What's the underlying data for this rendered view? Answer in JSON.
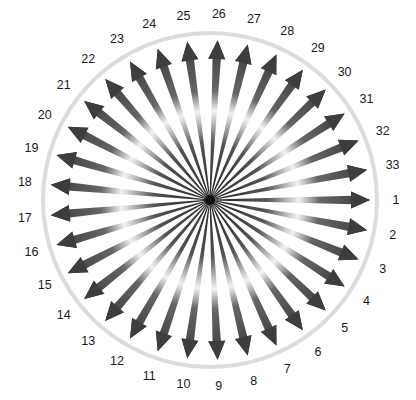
{
  "diagram": {
    "type": "radial-arrow-starburst",
    "center": {
      "x": 210,
      "y": 200
    },
    "ring_radius": 167,
    "arrow_tip_radius": 160,
    "label_radius": 186,
    "start_angle_deg": 0,
    "direction": "clockwise",
    "colors": {
      "arrow_dark": "#3a3a3a",
      "arrow_mid": "#6e6e6e",
      "arrow_highlight": "#f2f2f2",
      "ring": "#d9d9d9",
      "hub": "#111111",
      "label": "#1a1a1a"
    },
    "arrows": [
      {
        "label": "1"
      },
      {
        "label": "2"
      },
      {
        "label": "3"
      },
      {
        "label": "4"
      },
      {
        "label": "5"
      },
      {
        "label": "6"
      },
      {
        "label": "7"
      },
      {
        "label": "8"
      },
      {
        "label": "9"
      },
      {
        "label": "10"
      },
      {
        "label": "11"
      },
      {
        "label": "12"
      },
      {
        "label": "13"
      },
      {
        "label": "14"
      },
      {
        "label": "15"
      },
      {
        "label": "16"
      },
      {
        "label": "17"
      },
      {
        "label": "18"
      },
      {
        "label": "19"
      },
      {
        "label": "20"
      },
      {
        "label": "21"
      },
      {
        "label": "22"
      },
      {
        "label": "23"
      },
      {
        "label": "24"
      },
      {
        "label": "25"
      },
      {
        "label": "26"
      },
      {
        "label": "27"
      },
      {
        "label": "28"
      },
      {
        "label": "29"
      },
      {
        "label": "30"
      },
      {
        "label": "31"
      },
      {
        "label": "32"
      },
      {
        "label": "33"
      }
    ]
  }
}
